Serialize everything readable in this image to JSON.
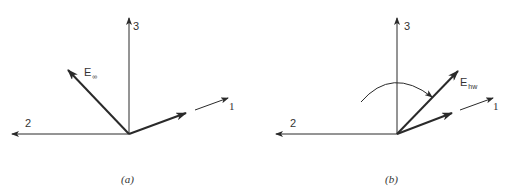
{
  "panels": [
    {
      "id": "a",
      "caption": "(a)",
      "axes": {
        "axis1": "1",
        "axis2": "2",
        "axis3": "3"
      },
      "vector": {
        "base": "E",
        "subscript": "∞"
      }
    },
    {
      "id": "b",
      "caption": "(b)",
      "axes": {
        "axis1": "1",
        "axis2": "2",
        "axis3": "3"
      },
      "vector": {
        "base": "E",
        "subscript": "hw"
      },
      "rotation_arc": true
    }
  ],
  "colors": {
    "line": "#2a2a2a",
    "text": "#333333"
  }
}
